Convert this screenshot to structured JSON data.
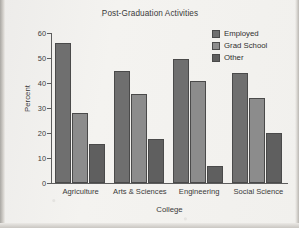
{
  "chart_data": {
    "type": "bar",
    "title": "Post-Graduation Activities",
    "xlabel": "College",
    "ylabel": "Percent",
    "categories": [
      "Agriculture",
      "Arts & Sciences",
      "Engineering",
      "Social Science"
    ],
    "series": [
      {
        "name": "Employed",
        "values": [
          56,
          45,
          49.5,
          44
        ],
        "color": "#6f6f6f"
      },
      {
        "name": "Grad School",
        "values": [
          28,
          35.5,
          41,
          34
        ],
        "color": "#8c8c8c"
      },
      {
        "name": "Other",
        "values": [
          15.5,
          17.5,
          7,
          20
        ],
        "color": "#5f5f5f"
      }
    ],
    "ylim": [
      0,
      60
    ],
    "yticks": [
      0,
      10,
      20,
      30,
      40,
      50,
      60
    ],
    "ytick_labels": [
      "0",
      "10",
      "20",
      "30",
      "40",
      "50",
      "60"
    ],
    "grid": false,
    "legend_position": "top-right"
  }
}
